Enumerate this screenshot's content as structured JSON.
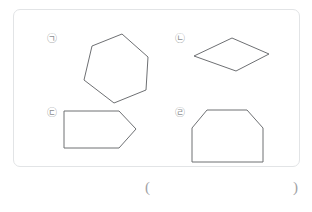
{
  "document": {
    "type": "worksheet-figure-panel",
    "frame": {
      "border_color": "#e2e4e6",
      "background": "#ffffff",
      "corner_radius_px": 7
    },
    "stroke_color": "#6e7073",
    "label_color": "#8d8f92"
  },
  "figures": [
    {
      "id": "figure-1",
      "label": "㉠",
      "shape_name": "hexagon",
      "sides": 6,
      "points": "26,12 56,0 82,23 80,56 48,69 18,46"
    },
    {
      "id": "figure-2",
      "label": "㉡",
      "shape_name": "rhombus",
      "sides": 4,
      "points": "38,0 75,16 42,33 0,18"
    },
    {
      "id": "figure-3",
      "label": "㉢",
      "shape_name": "pentagon-arrow",
      "sides": 5,
      "points": "0,0 55,0 72,18 55,37 0,37"
    },
    {
      "id": "figure-4",
      "label": "㉣",
      "shape_name": "hexagon",
      "sides": 6,
      "points": "15,0 55,0 71,18 71,52 0,52 0,18"
    }
  ],
  "answer": {
    "open_paren": "(",
    "close_paren": ")",
    "value": ""
  }
}
